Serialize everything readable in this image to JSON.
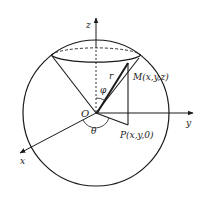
{
  "figure": {
    "labels": {
      "z_axis": "z",
      "y_axis": "y",
      "x_axis": "x",
      "origin": "O",
      "radius": "r",
      "polar_angle": "φ",
      "azimuth_angle": "θ",
      "point_M": "M(x,y,z)",
      "point_P": "P(x,y,0)"
    },
    "colors": {
      "stroke": "#1a1a1a",
      "background": "#ffffff"
    }
  }
}
